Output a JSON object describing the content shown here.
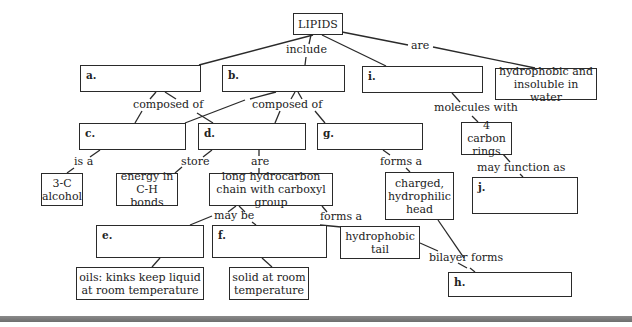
{
  "title": "LIPIDS",
  "nodes": {
    "root": "LIPIDS",
    "a": "a.",
    "b": "b.",
    "i": "i.",
    "hydrophobic": "hydrophobic and insoluble in water",
    "c": "c.",
    "d": "d.",
    "g": "g.",
    "rings": "4 carbon rings",
    "alcohol": "3-C alcohol",
    "energy": "energy in C-H bonds",
    "chain": "long hydrocarbon chain with carboxyl group",
    "head": "charged, hydrophilic head",
    "j": "j.",
    "e": "e.",
    "f": "f.",
    "tail": "hydrophobic tail",
    "oils": "oils: kinks keep liquid at room temperature",
    "solid": "solid at room temperature",
    "h": "h."
  },
  "links": {
    "include": "include",
    "are_top": "are",
    "composed_left": "composed of",
    "composed_right": "composed of",
    "molecules_with": "molecules with",
    "is_a": "is a",
    "store": "store",
    "are_mid": "are",
    "forms_a_g": "forms a",
    "may_function_as": "may function as",
    "may_be": "may be",
    "forms_a_chain": "forms a",
    "bilayer_forms": "bilayer forms"
  },
  "colors": {
    "line": "#2a2a2a",
    "bar": "#7a7a7a",
    "background": "#ffffff"
  }
}
